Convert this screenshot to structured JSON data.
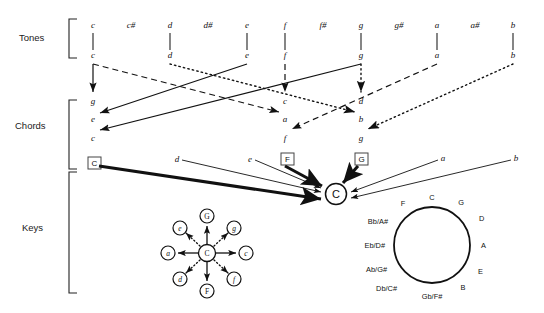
{
  "diagram": {
    "levels": [
      {
        "id": "tones",
        "label": "Tones"
      },
      {
        "id": "chords",
        "label": "Chords"
      },
      {
        "id": "keys",
        "label": "Keys"
      }
    ],
    "colors": {
      "ink": "#111111",
      "background": "#ffffff",
      "box_stroke": "#444444"
    }
  },
  "tones": {
    "chromatic_row": [
      {
        "name": "c",
        "x": 93,
        "sharp": false
      },
      {
        "name": "c#",
        "x": 131,
        "sharp": true
      },
      {
        "name": "d",
        "x": 170,
        "sharp": false
      },
      {
        "name": "d#",
        "x": 208,
        "sharp": true
      },
      {
        "name": "e",
        "x": 247,
        "sharp": false
      },
      {
        "name": "f",
        "x": 285,
        "sharp": false
      },
      {
        "name": "f#",
        "x": 323,
        "sharp": true
      },
      {
        "name": "g",
        "x": 361,
        "sharp": false
      },
      {
        "name": "g#",
        "x": 399,
        "sharp": true
      },
      {
        "name": "a",
        "x": 437,
        "sharp": false
      },
      {
        "name": "a#",
        "x": 475,
        "sharp": true
      },
      {
        "name": "b",
        "x": 513,
        "sharp": false
      }
    ],
    "natural_row": [
      {
        "name": "c",
        "x": 93
      },
      {
        "name": "d",
        "x": 170
      },
      {
        "name": "e",
        "x": 247
      },
      {
        "name": "f",
        "x": 285
      },
      {
        "name": "g",
        "x": 361
      },
      {
        "name": "a",
        "x": 437
      },
      {
        "name": "b",
        "x": 513
      }
    ]
  },
  "chords": {
    "groups": [
      {
        "id": "c-major",
        "root_box": "C",
        "members": [
          "g",
          "e",
          "c"
        ],
        "x": 93
      },
      {
        "id": "f-major",
        "root_box": "F",
        "members": [
          "c",
          "a",
          "f"
        ],
        "x": 285
      },
      {
        "id": "g-major",
        "root_box": "G",
        "members": [
          "d",
          "b",
          "g"
        ],
        "x": 361
      }
    ]
  },
  "keys": {
    "sources": [
      {
        "label": "C",
        "boxed": true,
        "x": 95,
        "style": "thick"
      },
      {
        "label": "d",
        "boxed": false,
        "x": 177,
        "style": "thin"
      },
      {
        "label": "e",
        "boxed": false,
        "x": 250,
        "style": "thin"
      },
      {
        "label": "F",
        "boxed": true,
        "x": 287,
        "style": "thick"
      },
      {
        "label": "G",
        "boxed": true,
        "x": 361,
        "style": "thick"
      },
      {
        "label": "a",
        "boxed": false,
        "x": 443,
        "style": "thin"
      },
      {
        "label": "b",
        "boxed": false,
        "x": 516,
        "style": "thin"
      }
    ],
    "target": {
      "label": "C",
      "circled": true,
      "x": 336,
      "y": 194
    }
  },
  "star_diagram": {
    "center": {
      "label": "C",
      "x": 207,
      "y": 253
    },
    "nodes": [
      {
        "label": "G",
        "position": "top",
        "italic": false,
        "x": 207,
        "y": 216,
        "line": "solid"
      },
      {
        "label": "g",
        "position": "top-right",
        "italic": true,
        "x": 234,
        "y": 228,
        "line": "dotted"
      },
      {
        "label": "c",
        "position": "right",
        "italic": true,
        "x": 246,
        "y": 253,
        "line": "solid"
      },
      {
        "label": "f",
        "position": "bottom-right",
        "italic": true,
        "x": 234,
        "y": 279,
        "line": "dotted"
      },
      {
        "label": "F",
        "position": "bottom",
        "italic": false,
        "x": 207,
        "y": 291,
        "line": "solid"
      },
      {
        "label": "d",
        "position": "bottom-left",
        "italic": true,
        "x": 180,
        "y": 279,
        "line": "dotted"
      },
      {
        "label": "a",
        "position": "left",
        "italic": true,
        "x": 168,
        "y": 253,
        "line": "solid"
      },
      {
        "label": "e",
        "position": "top-left",
        "italic": true,
        "x": 180,
        "y": 228,
        "line": "dotted"
      }
    ]
  },
  "circle_of_fifths": {
    "center_x": 432,
    "center_y": 245,
    "radius": 38,
    "segments": [
      {
        "label": "C",
        "angle": -90
      },
      {
        "label": "G",
        "angle": -60
      },
      {
        "label": "D",
        "angle": -30
      },
      {
        "label": "A",
        "angle": 0
      },
      {
        "label": "E",
        "angle": 30
      },
      {
        "label": "B",
        "angle": 60
      },
      {
        "label": "Gb/F#",
        "angle": 90
      },
      {
        "label": "Db/C#",
        "angle": 120
      },
      {
        "label": "Ab/G#",
        "angle": 150
      },
      {
        "label": "Eb/D#",
        "angle": 180
      },
      {
        "label": "Bb/A#",
        "angle": 210
      },
      {
        "label": "F",
        "angle": 240
      }
    ]
  }
}
